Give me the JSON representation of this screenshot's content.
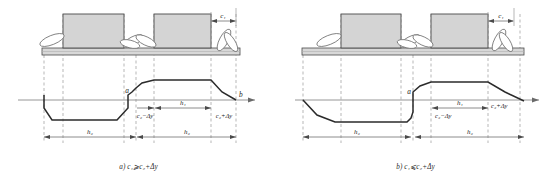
{
  "figure": {
    "type": "engineering-cross-section",
    "panel_count": 2,
    "colors": {
      "outline": "#3a3a3a",
      "profile_line": "#2b2b2b",
      "block_fill": "#d4d4d4",
      "slab_fill": "#d8d8d8",
      "dashed_guide": "#9a9a9a",
      "axis": "#8a8a8a",
      "dimension": "#6f6f6f",
      "text": "#1a1a1a",
      "background": "#ffffff"
    }
  },
  "panels": [
    {
      "id": "a",
      "caption_label": "a)",
      "caption_expr": "c₁⩾c₂+Δy",
      "caption_full": "a) c₁⩾c₂+Δy",
      "point_labels": {
        "left_point": "a",
        "right_point": "b"
      },
      "top_dimension": {
        "label": "c₁"
      },
      "mid_dimensions": [
        {
          "label": "c₂−Δy"
        },
        {
          "label": "h₁"
        },
        {
          "label": "c₂+Δy"
        }
      ],
      "bottom_dimensions": [
        {
          "label": "h₂"
        },
        {
          "label": "h₂"
        }
      ],
      "blocks": [
        {
          "name": "block-left"
        },
        {
          "name": "block-right"
        }
      ],
      "foliage_count": 6
    },
    {
      "id": "b",
      "caption_label": "b)",
      "caption_expr": "c₁⩽c₂+Δy",
      "caption_full": "b) c₁⩽c₂+Δy",
      "point_labels": {
        "left_point": "a",
        "right_point": ""
      },
      "top_dimension": {
        "label": "c₁"
      },
      "mid_dimensions": [
        {
          "label": "c₂−Δy"
        },
        {
          "label": "h₁"
        },
        {
          "label": "c₂+Δy"
        }
      ],
      "bottom_dimensions": [
        {
          "label": "h₂"
        },
        {
          "label": "h₂"
        }
      ],
      "blocks": [
        {
          "name": "block-left"
        },
        {
          "name": "block-right"
        }
      ],
      "foliage_count": 6
    }
  ]
}
